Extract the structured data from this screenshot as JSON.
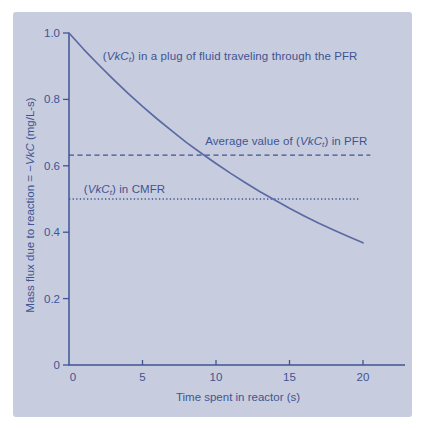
{
  "figure": {
    "background": "#ffffff",
    "panel_color": "#c7cdde",
    "ink_color": "#3f5494",
    "curve_color": "#5b6aa4"
  },
  "chart_data": {
    "type": "line",
    "title": "",
    "xlabel": "Time spent in reactor (s)",
    "ylabel_text": "Mass flux due to reaction = −VkC (mg/L-s)",
    "ylabel_runs": [
      {
        "t": "Mass flux due to reaction = −"
      },
      {
        "t": "VkC",
        "style": "i"
      },
      {
        "t": " (mg/L-s)"
      }
    ],
    "xlim": [
      0,
      22.9
    ],
    "ylim": [
      0,
      1.0
    ],
    "grid": false,
    "legend": "none (inline annotations)",
    "x_ticks": [
      {
        "v": 0,
        "label": "0"
      },
      {
        "v": 5,
        "label": "5"
      },
      {
        "v": 10,
        "label": "10"
      },
      {
        "v": 15,
        "label": "15"
      },
      {
        "v": 20,
        "label": "20"
      }
    ],
    "y_ticks": [
      {
        "v": 0,
        "label": "0"
      },
      {
        "v": 0.2,
        "label": "0.2"
      },
      {
        "v": 0.4,
        "label": "0.4"
      },
      {
        "v": 0.6,
        "label": "0.6"
      },
      {
        "v": 0.8,
        "label": "0.8"
      },
      {
        "v": 1.0,
        "label": "1.0"
      }
    ],
    "series": [
      {
        "name": "(VkCt) in a plug of fluid traveling through the PFR",
        "x": [
          0,
          1,
          2,
          3,
          4,
          5,
          6,
          7,
          8,
          9,
          10,
          11,
          12,
          13,
          14,
          15,
          16,
          17,
          18,
          19,
          20
        ],
        "values": [
          1.0,
          0.951,
          0.905,
          0.861,
          0.819,
          0.779,
          0.741,
          0.705,
          0.67,
          0.638,
          0.607,
          0.577,
          0.549,
          0.522,
          0.497,
          0.472,
          0.449,
          0.427,
          0.407,
          0.387,
          0.368
        ]
      }
    ],
    "ref_lines": [
      {
        "name": "Average value of (VkCt) in PFR",
        "value": 0.632,
        "style": "dashed",
        "x_start": 0,
        "x_end": 20.5
      },
      {
        "name": "(VkCt) in CMFR",
        "value": 0.5,
        "style": "dotted",
        "x_start": 0,
        "x_end": 19.8
      }
    ],
    "annotations": [
      {
        "id": "pfr-curve-label",
        "x": 2.3,
        "y": 0.928,
        "anchor": "start",
        "text": "(VkCt) in a plug of fluid traveling through the PFR",
        "runs": [
          {
            "t": "("
          },
          {
            "t": "VkC",
            "style": "i"
          },
          {
            "t": "t",
            "style": "sub"
          },
          {
            "t": ") in a plug of fluid traveling through the PFR"
          }
        ]
      },
      {
        "id": "avg-pfr-label",
        "x": 20.3,
        "y": 0.672,
        "anchor": "end",
        "text": "Average value of (VkCt) in PFR",
        "runs": [
          {
            "t": "Average value of ("
          },
          {
            "t": "VkC",
            "style": "i"
          },
          {
            "t": "t",
            "style": "sub"
          },
          {
            "t": ") in PFR"
          }
        ]
      },
      {
        "id": "cmfr-label",
        "x": 1.0,
        "y": 0.527,
        "anchor": "start",
        "text": "(VkCt) in CMFR",
        "runs": [
          {
            "t": "("
          },
          {
            "t": "VkC",
            "style": "i"
          },
          {
            "t": "t",
            "style": "sub"
          },
          {
            "t": ") in CMFR"
          }
        ]
      }
    ]
  }
}
